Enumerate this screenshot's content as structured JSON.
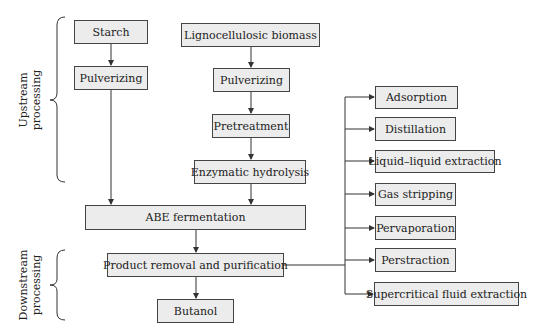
{
  "side_labels": {
    "upstream": [
      "Upstream",
      "processing"
    ],
    "downstream": [
      "Downstream",
      "processing"
    ]
  },
  "nodes": {
    "starch": "Starch",
    "pulverizing_starch": "Pulverizing",
    "lignocellulosic": "Lignocellulosic biomass",
    "pulverizing_ligno": "Pulverizing",
    "pretreatment": "Pretreatment",
    "enzymatic": "Enzymatic hydrolysis",
    "abe": "ABE fermentation",
    "product_removal": "Product removal and purification",
    "butanol": "Butanol"
  },
  "methods": [
    "Adsorption",
    "Distillation",
    "Liquid–liquid extraction",
    "Gas stripping",
    "Pervaporation",
    "Perstraction",
    "Supercritical fluid extraction"
  ],
  "colors": {
    "box_fill": "#ececec",
    "stroke": "#444444"
  }
}
